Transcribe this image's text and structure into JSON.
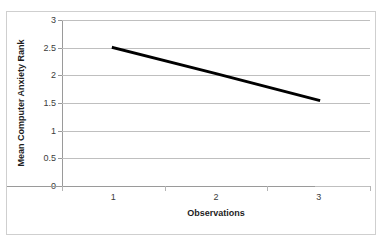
{
  "scan_artifact": {
    "visible": true,
    "fragments": [
      "'",
      "·",
      "-"
    ]
  },
  "chart_data": {
    "type": "line",
    "title": "",
    "xlabel": "Observations",
    "ylabel": "Mean Computer Anxiety Rank",
    "categories": [
      "1",
      "2",
      "3"
    ],
    "values": [
      2.5,
      2.03,
      1.55
    ],
    "series": [
      {
        "name": "Mean Computer Anxiety Rank",
        "values": [
          2.5,
          2.03,
          1.55
        ],
        "color": "#000000",
        "line_width": 3,
        "markers": false
      }
    ],
    "ylim": [
      0,
      3
    ],
    "ytick_labels": [
      "0",
      "0.5",
      "1",
      "1.5",
      "2",
      "2.5",
      "3"
    ],
    "ytick_values": [
      0,
      0.5,
      1,
      1.5,
      2,
      2.5,
      3
    ],
    "xtick_labels": [
      "1",
      "2",
      "3"
    ],
    "grid": "horizontal",
    "legend": "none",
    "plot_background": "#ffffff",
    "gridline_color": "#bfbfbf",
    "axis_color": "#9a9a9a",
    "frame_color": "#cfcfcf"
  }
}
